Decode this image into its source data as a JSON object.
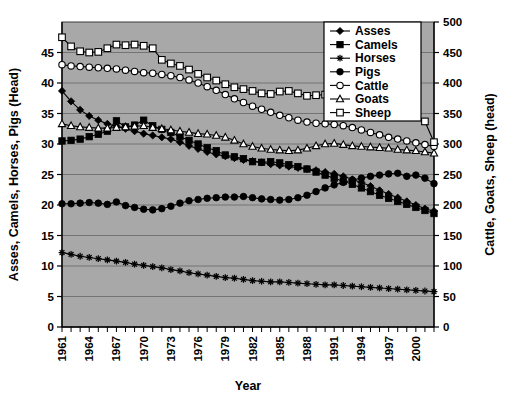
{
  "chart_data": {
    "type": "line",
    "title": "",
    "xlabel": "Year",
    "ylabel": "Asses, Camels, Horses, Pigs (Head)",
    "y2label": "Cattle, Goats, Sheep (head)",
    "grid": true,
    "legend_position": "top-right",
    "xlim": [
      1961,
      2002
    ],
    "ylim": [
      0,
      50
    ],
    "y2lim": [
      0,
      500
    ],
    "yticks": [
      0,
      5,
      10,
      15,
      20,
      25,
      30,
      35,
      40,
      45
    ],
    "y2ticks": [
      0,
      50,
      100,
      150,
      200,
      250,
      300,
      350,
      400,
      450,
      500
    ],
    "xticks": [
      1961,
      1964,
      1967,
      1970,
      1973,
      1976,
      1979,
      1982,
      1985,
      1988,
      1991,
      1994,
      1997,
      2000
    ],
    "xtick_labels": [
      "1961",
      "1964",
      "1967",
      "1970",
      "1973",
      "1976",
      "1979",
      "1982",
      "1985",
      "1988",
      "1991",
      "1994",
      "1997",
      "2000"
    ],
    "ytick_labels": [
      "0",
      "5",
      "10",
      "15",
      "20",
      "25",
      "30",
      "35",
      "40",
      "45"
    ],
    "y2tick_labels": [
      "0",
      "50",
      "100",
      "150",
      "200",
      "250",
      "300",
      "350",
      "400",
      "450",
      "500"
    ],
    "x": [
      1961,
      1962,
      1963,
      1964,
      1965,
      1966,
      1967,
      1968,
      1969,
      1970,
      1971,
      1972,
      1973,
      1974,
      1975,
      1976,
      1977,
      1978,
      1979,
      1980,
      1981,
      1982,
      1983,
      1984,
      1985,
      1986,
      1987,
      1988,
      1989,
      1990,
      1991,
      1992,
      1993,
      1994,
      1995,
      1996,
      1997,
      1998,
      1999,
      2000,
      2001,
      2002
    ],
    "series": [
      {
        "name": "Asses",
        "axis": "left",
        "marker": "filled-diamond",
        "values": [
          38.7,
          37.0,
          35.6,
          34.6,
          33.9,
          33.3,
          32.9,
          32.5,
          32.1,
          31.7,
          31.4,
          31.1,
          30.8,
          30.3,
          29.7,
          29.2,
          28.7,
          28.3,
          28.0,
          27.7,
          27.4,
          27.2,
          27.0,
          26.7,
          26.5,
          26.3,
          26.1,
          25.9,
          25.7,
          25.4,
          25.1,
          24.7,
          24.2,
          23.7,
          23.1,
          22.4,
          21.8,
          21.2,
          20.6,
          20.0,
          19.4,
          19.0
        ]
      },
      {
        "name": "Camels",
        "axis": "left",
        "marker": "filled-square",
        "values": [
          30.5,
          30.6,
          30.8,
          31.2,
          31.6,
          32.1,
          33.8,
          32.8,
          33.1,
          33.9,
          33.0,
          32.4,
          31.9,
          31.2,
          30.6,
          30.0,
          29.4,
          28.9,
          28.2,
          27.9,
          27.6,
          27.1,
          27.0,
          27.1,
          26.9,
          26.6,
          26.3,
          25.9,
          25.4,
          24.9,
          24.4,
          23.9,
          23.4,
          22.8,
          22.2,
          21.6,
          21.1,
          20.6,
          20.1,
          19.6,
          19.1,
          18.6
        ]
      },
      {
        "name": "Horses",
        "axis": "left",
        "marker": "star",
        "values": [
          12.2,
          11.9,
          11.6,
          11.4,
          11.2,
          11.0,
          10.8,
          10.6,
          10.3,
          10.1,
          9.9,
          9.7,
          9.4,
          9.2,
          8.9,
          8.7,
          8.5,
          8.3,
          8.1,
          8.0,
          7.8,
          7.6,
          7.5,
          7.4,
          7.4,
          7.3,
          7.2,
          7.1,
          7.0,
          6.9,
          6.9,
          6.8,
          6.7,
          6.6,
          6.5,
          6.4,
          6.3,
          6.2,
          6.1,
          6.0,
          5.9,
          5.8
        ]
      },
      {
        "name": "Pigs",
        "axis": "left",
        "marker": "filled-circle",
        "values": [
          20.2,
          20.2,
          20.3,
          20.4,
          20.3,
          20.1,
          20.5,
          19.9,
          19.6,
          19.3,
          19.2,
          19.4,
          19.8,
          20.3,
          20.7,
          20.9,
          21.1,
          21.2,
          21.3,
          21.3,
          21.4,
          21.2,
          21.0,
          20.9,
          20.8,
          20.9,
          21.2,
          21.6,
          22.2,
          22.8,
          23.3,
          23.7,
          24.1,
          24.4,
          24.7,
          24.9,
          25.1,
          25.2,
          24.7,
          24.9,
          24.4,
          23.5
        ]
      },
      {
        "name": "Cattle",
        "axis": "right",
        "marker": "open-circle",
        "values": [
          430,
          428,
          427,
          426,
          425,
          424,
          423,
          421,
          419,
          417,
          416,
          414,
          412,
          409,
          405,
          400,
          394,
          388,
          381,
          374,
          368,
          362,
          357,
          352,
          347,
          343,
          339,
          336,
          334,
          333,
          332,
          330,
          327,
          323,
          319,
          315,
          311,
          308,
          305,
          302,
          299,
          296
        ]
      },
      {
        "name": "Goats",
        "axis": "right",
        "marker": "open-triangle",
        "values": [
          333,
          330,
          328,
          327,
          326,
          326,
          327,
          328,
          329,
          330,
          327,
          325,
          323,
          321,
          319,
          317,
          316,
          314,
          311,
          306,
          300,
          296,
          293,
          291,
          290,
          289,
          290,
          293,
          297,
          300,
          301,
          299,
          297,
          296,
          295,
          294,
          293,
          291,
          290,
          289,
          287,
          285
        ]
      },
      {
        "name": "Sheep",
        "axis": "right",
        "marker": "open-square",
        "values": [
          475,
          460,
          452,
          450,
          451,
          457,
          463,
          462,
          463,
          461,
          457,
          438,
          432,
          428,
          422,
          415,
          409,
          404,
          398,
          393,
          390,
          387,
          383,
          382,
          386,
          387,
          383,
          379,
          380,
          381,
          384,
          382,
          378,
          374,
          370,
          366,
          362,
          358,
          352,
          345,
          337,
          303
        ]
      }
    ]
  },
  "axis": {
    "ylabel": "Asses, Camels, Horses, Pigs (Head)",
    "y2label": "Cattle, Goats, Sheep (head)",
    "xlabel": "Year"
  },
  "legend": {
    "items": [
      {
        "label": "Asses",
        "marker": "filled-diamond"
      },
      {
        "label": "Camels",
        "marker": "filled-square"
      },
      {
        "label": "Horses",
        "marker": "star"
      },
      {
        "label": "Pigs",
        "marker": "filled-circle"
      },
      {
        "label": "Cattle",
        "marker": "open-circle"
      },
      {
        "label": "Goats",
        "marker": "open-triangle"
      },
      {
        "label": "Sheep",
        "marker": "open-square"
      }
    ]
  },
  "colors": {
    "plot_background": "#a8a8a8",
    "page_background": "#ffffff",
    "line": "#000000",
    "grid": "#6e6e6e",
    "legend_background": "#ffffff",
    "legend_border": "#000000"
  }
}
